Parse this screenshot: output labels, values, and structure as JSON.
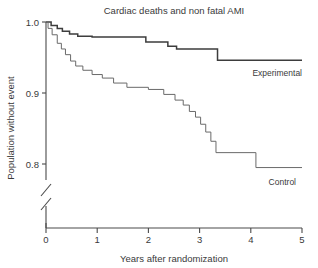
{
  "chart_data": {
    "type": "line",
    "title": "Cardiac deaths and non fatal AMI",
    "xlabel": "Years after randomization",
    "ylabel": "Population without event",
    "xlim": [
      0,
      5
    ],
    "ylim": [
      0.78,
      1.0
    ],
    "xticks": [
      0,
      1,
      2,
      3,
      4,
      5
    ],
    "xticklabels": [
      "0",
      "1",
      "2",
      "3",
      "4",
      "5"
    ],
    "yticks": [
      1.0,
      0.9,
      0.8
    ],
    "yticklabels": [
      "1.0",
      "0.9",
      "0.8"
    ],
    "grid": false,
    "legend_position": "inline-right-of-curves",
    "axis_break": "y-axis broken below 0.8",
    "series": [
      {
        "name": "Experimental",
        "label": "Experimental",
        "color": "#3d3d3d",
        "style": "step-post-thick",
        "points": [
          [
            0.0,
            1.0
          ],
          [
            0.1,
            1.0
          ],
          [
            0.1,
            0.995
          ],
          [
            0.22,
            0.995
          ],
          [
            0.22,
            0.991
          ],
          [
            0.32,
            0.991
          ],
          [
            0.32,
            0.987
          ],
          [
            0.46,
            0.987
          ],
          [
            0.46,
            0.983
          ],
          [
            0.62,
            0.983
          ],
          [
            0.62,
            0.98
          ],
          [
            0.9,
            0.98
          ],
          [
            0.9,
            0.979
          ],
          [
            1.95,
            0.979
          ],
          [
            1.95,
            0.972
          ],
          [
            2.38,
            0.972
          ],
          [
            2.38,
            0.966
          ],
          [
            2.55,
            0.966
          ],
          [
            2.55,
            0.962
          ],
          [
            3.35,
            0.962
          ],
          [
            3.35,
            0.946
          ],
          [
            5.0,
            0.946
          ]
        ]
      },
      {
        "name": "Control",
        "label": "Control",
        "color": "#6a6a6a",
        "style": "step-post-thin",
        "points": [
          [
            0.0,
            1.0
          ],
          [
            0.04,
            1.0
          ],
          [
            0.04,
            0.991
          ],
          [
            0.12,
            0.991
          ],
          [
            0.12,
            0.982
          ],
          [
            0.22,
            0.982
          ],
          [
            0.22,
            0.97
          ],
          [
            0.3,
            0.97
          ],
          [
            0.3,
            0.962
          ],
          [
            0.38,
            0.962
          ],
          [
            0.38,
            0.954
          ],
          [
            0.48,
            0.954
          ],
          [
            0.48,
            0.945
          ],
          [
            0.58,
            0.945
          ],
          [
            0.58,
            0.938
          ],
          [
            0.72,
            0.938
          ],
          [
            0.72,
            0.932
          ],
          [
            0.9,
            0.932
          ],
          [
            0.9,
            0.926
          ],
          [
            1.1,
            0.926
          ],
          [
            1.1,
            0.921
          ],
          [
            1.32,
            0.921
          ],
          [
            1.32,
            0.914
          ],
          [
            1.58,
            0.914
          ],
          [
            1.58,
            0.908
          ],
          [
            2.0,
            0.908
          ],
          [
            2.0,
            0.905
          ],
          [
            2.3,
            0.905
          ],
          [
            2.3,
            0.898
          ],
          [
            2.52,
            0.898
          ],
          [
            2.52,
            0.89
          ],
          [
            2.68,
            0.89
          ],
          [
            2.68,
            0.883
          ],
          [
            2.8,
            0.883
          ],
          [
            2.8,
            0.874
          ],
          [
            2.92,
            0.874
          ],
          [
            2.92,
            0.866
          ],
          [
            3.02,
            0.866
          ],
          [
            3.02,
            0.856
          ],
          [
            3.12,
            0.856
          ],
          [
            3.12,
            0.845
          ],
          [
            3.22,
            0.845
          ],
          [
            3.22,
            0.832
          ],
          [
            3.32,
            0.832
          ],
          [
            3.32,
            0.816
          ],
          [
            4.1,
            0.816
          ],
          [
            4.1,
            0.795
          ],
          [
            5.0,
            0.795
          ]
        ]
      }
    ]
  }
}
